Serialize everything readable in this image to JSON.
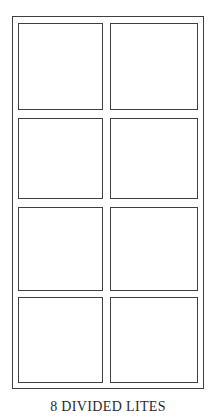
{
  "figure": {
    "caption": "8 DIVIDED LITES",
    "colors": {
      "line": "#3f3f3f",
      "background": "#ffffff",
      "caption_text": "#2b2b2b"
    },
    "frame": {
      "name": "window-outer-frame",
      "left": 12,
      "top": 16,
      "width": 192,
      "height": 373
    },
    "grid": {
      "rows": 4,
      "columns": 2,
      "pane_count": 8
    },
    "panes": [
      {
        "label": "pane-row1-col1",
        "row": 1,
        "column": 1,
        "left": 18,
        "top": 23,
        "width": 85,
        "height": 87
      },
      {
        "label": "pane-row1-col2",
        "row": 1,
        "column": 2,
        "left": 110,
        "top": 23,
        "width": 88,
        "height": 87
      },
      {
        "label": "pane-row2-col1",
        "row": 2,
        "column": 1,
        "left": 18,
        "top": 118,
        "width": 85,
        "height": 81
      },
      {
        "label": "pane-row2-col2",
        "row": 2,
        "column": 2,
        "left": 110,
        "top": 118,
        "width": 88,
        "height": 81
      },
      {
        "label": "pane-row3-col1",
        "row": 3,
        "column": 1,
        "left": 18,
        "top": 207,
        "width": 85,
        "height": 84
      },
      {
        "label": "pane-row3-col2",
        "row": 3,
        "column": 2,
        "left": 110,
        "top": 207,
        "width": 88,
        "height": 84
      },
      {
        "label": "pane-row4-col1",
        "row": 4,
        "column": 1,
        "left": 18,
        "top": 297,
        "width": 85,
        "height": 86
      },
      {
        "label": "pane-row4-col2",
        "row": 4,
        "column": 2,
        "left": 110,
        "top": 297,
        "width": 88,
        "height": 86
      }
    ],
    "caption_position": {
      "top": 400
    }
  }
}
